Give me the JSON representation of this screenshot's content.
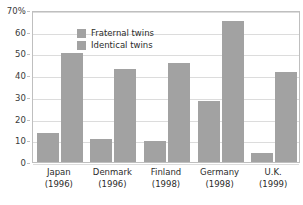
{
  "chart_data": {
    "type": "bar",
    "title": "",
    "xlabel": "",
    "ylabel": "",
    "ylim": [
      0,
      70
    ],
    "ytick_labels": [
      "0",
      "10",
      "20",
      "30",
      "40",
      "50",
      "60",
      "70%"
    ],
    "yticks": [
      0,
      10,
      20,
      30,
      40,
      50,
      60,
      70
    ],
    "grid": true,
    "legend_position": "top-left",
    "categories": [
      "Japan",
      "Denmark",
      "Finland",
      "Germany",
      "U.K."
    ],
    "category_years": [
      "(1996)",
      "(1996)",
      "(1998)",
      "(1998)",
      "(1999)"
    ],
    "series": [
      {
        "name": "Fraternal twins",
        "color": "#a2a2a2",
        "values": [
          13.5,
          10.5,
          9.5,
          28,
          4
        ]
      },
      {
        "name": "Identical twins",
        "color": "#a2a2a2",
        "values": [
          50,
          43,
          45.5,
          65,
          41.5
        ]
      }
    ]
  },
  "legend": {
    "items": [
      {
        "label": "Fraternal twins"
      },
      {
        "label": "Identical twins"
      }
    ]
  },
  "colors": {
    "bar": "#a2a2a2",
    "gridline": "#dcdcdc",
    "frame": "#bfbfbf",
    "text": "#2b2b2b"
  }
}
